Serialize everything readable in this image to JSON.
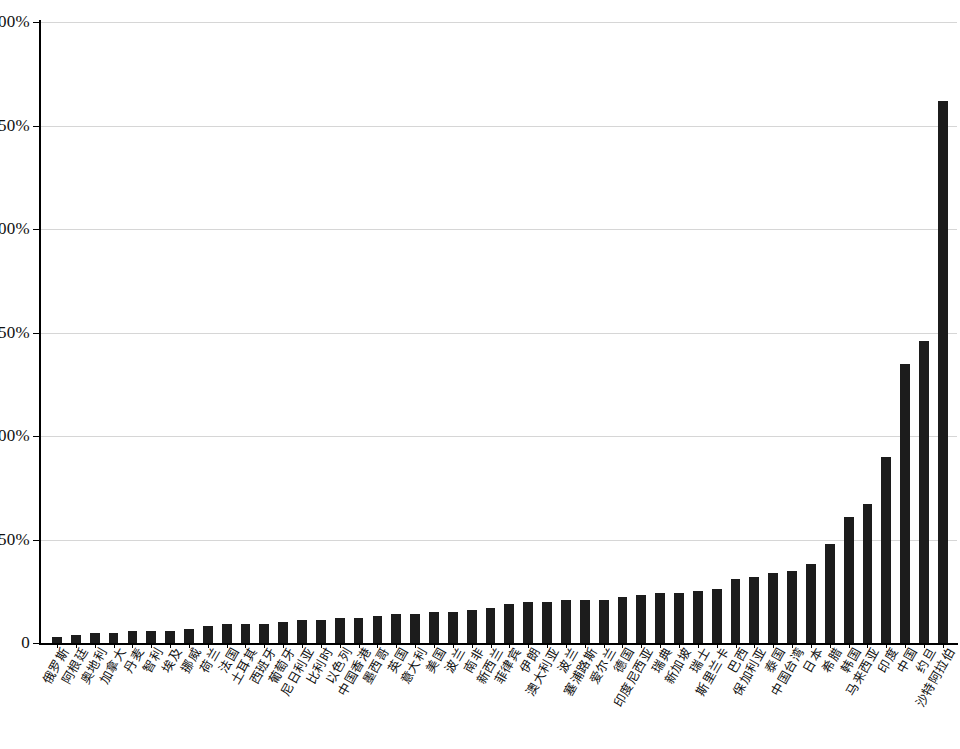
{
  "chart_data": {
    "type": "bar",
    "title": "",
    "xlabel": "",
    "ylabel": "",
    "ylim": [
      0,
      300
    ],
    "ytick_labels": [
      "0",
      "50%",
      "100%",
      "150%",
      "200%",
      "250%",
      "300%"
    ],
    "ytick_values": [
      0,
      50,
      100,
      150,
      200,
      250,
      300
    ],
    "grid": true,
    "legend": "none",
    "value_unit": "%",
    "bar_color": "#1c1c1c",
    "categories": [
      "俄罗斯",
      "阿根廷",
      "奥地利",
      "加拿大",
      "丹麦",
      "智利",
      "埃及",
      "挪威",
      "荷兰",
      "法国",
      "土耳其",
      "西班牙",
      "葡萄牙",
      "尼日利亚",
      "比利时",
      "以色列",
      "中国香港",
      "墨西哥",
      "英国",
      "意大利",
      "美国",
      "波兰",
      "南非",
      "新西兰",
      "菲律宾",
      "伊朗",
      "澳大利亚",
      "波兰",
      "塞浦路斯",
      "爱尔兰",
      "德国",
      "印度尼西亚",
      "瑞典",
      "新加坡",
      "瑞士",
      "斯里兰卡",
      "巴西",
      "保加利亚",
      "泰国",
      "中国台湾",
      "日本",
      "希腊",
      "韩国",
      "马来西亚",
      "印度",
      "中国",
      "约旦",
      "沙特阿拉伯"
    ],
    "values": [
      3,
      4,
      5,
      5,
      6,
      6,
      6,
      7,
      8,
      9,
      9,
      9,
      10,
      11,
      11,
      12,
      12,
      13,
      14,
      14,
      15,
      15,
      16,
      17,
      19,
      20,
      20,
      21,
      21,
      21,
      22,
      23,
      24,
      24,
      25,
      26,
      31,
      32,
      34,
      35,
      38,
      48,
      61,
      67,
      90,
      135,
      146,
      262
    ]
  }
}
